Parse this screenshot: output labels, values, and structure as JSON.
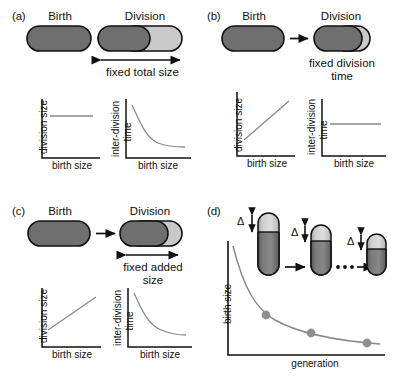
{
  "figure": {
    "type": "scientific-schematic",
    "width": 395,
    "height": 377,
    "background_color": "#ffffff"
  },
  "colors": {
    "cell_dark": "#6f6f6f",
    "cell_light": "#c9c9c9",
    "outline": "#111111",
    "plot_curve": "#8a8a8a",
    "axis": "#111111",
    "marker_dot": "#8f8f8f",
    "text": "#111111"
  },
  "panels": [
    {
      "id": "a",
      "label": "(a)",
      "model": "sizer",
      "birth_label": "Birth",
      "division_label": "Division",
      "annotation": "fixed total size",
      "annotation_lines": [
        "fixed total size"
      ],
      "has_span_arrow": true,
      "span_arrow_covers": "whole-cell",
      "charts": [
        {
          "id": "a-division-size",
          "xlabel": "birth size",
          "ylabel": "division size",
          "trend": "flat",
          "trend_description": "horizontal constant line"
        },
        {
          "id": "a-inter-division-time",
          "xlabel": "birth size",
          "ylabel": "inter-division time",
          "ylabel_lines": [
            "inter-division",
            "time"
          ],
          "trend": "decreasing-hyperbolic",
          "trend_description": "steeply decaying curve"
        }
      ]
    },
    {
      "id": "b",
      "label": "(b)",
      "model": "timer",
      "birth_label": "Birth",
      "division_label": "Division",
      "annotation": "fixed division time",
      "annotation_lines": [
        "fixed division",
        "time"
      ],
      "has_span_arrow": false,
      "span_arrow_covers": "none",
      "charts": [
        {
          "id": "b-division-size",
          "xlabel": "birth size",
          "ylabel": "division size",
          "trend": "increasing-linear",
          "trend_description": "straight line with positive slope"
        },
        {
          "id": "b-inter-division-time",
          "xlabel": "birth size",
          "ylabel": "inter-division time",
          "ylabel_lines": [
            "inter-division",
            "time"
          ],
          "trend": "flat",
          "trend_description": "horizontal constant line"
        }
      ]
    },
    {
      "id": "c",
      "label": "(c)",
      "model": "adder",
      "birth_label": "Birth",
      "division_label": "Division",
      "annotation": "fixed added size",
      "annotation_lines": [
        "fixed added",
        "size"
      ],
      "has_span_arrow": true,
      "span_arrow_covers": "added-portion",
      "charts": [
        {
          "id": "c-division-size",
          "xlabel": "birth size",
          "ylabel": "division size",
          "trend": "increasing-linear",
          "trend_description": "straight line with positive slope, shallower than (b)"
        },
        {
          "id": "c-inter-division-time",
          "xlabel": "birth size",
          "ylabel": "inter-division time",
          "ylabel_lines": [
            "inter-division",
            "time"
          ],
          "trend": "decreasing-hyperbolic",
          "trend_description": "decaying curve"
        }
      ]
    },
    {
      "id": "d",
      "label": "(d)",
      "model": "generational-convergence",
      "xlabel": "generation",
      "ylabel": "birth size",
      "delta_symbol": "Δ",
      "delta_count": 3,
      "ellipsis": "• • •",
      "cell_count": 3,
      "chart": {
        "type": "line",
        "xlabel": "generation",
        "ylabel": "birth size",
        "trend": "decaying-to-asymptote",
        "markers": 3,
        "marker_points": [
          {
            "generation": 1,
            "birth_size": 0.62
          },
          {
            "generation": 2,
            "birth_size": 0.4
          },
          {
            "generation": 3,
            "birth_size": 0.28
          }
        ],
        "grid": false,
        "legend": false
      }
    }
  ]
}
